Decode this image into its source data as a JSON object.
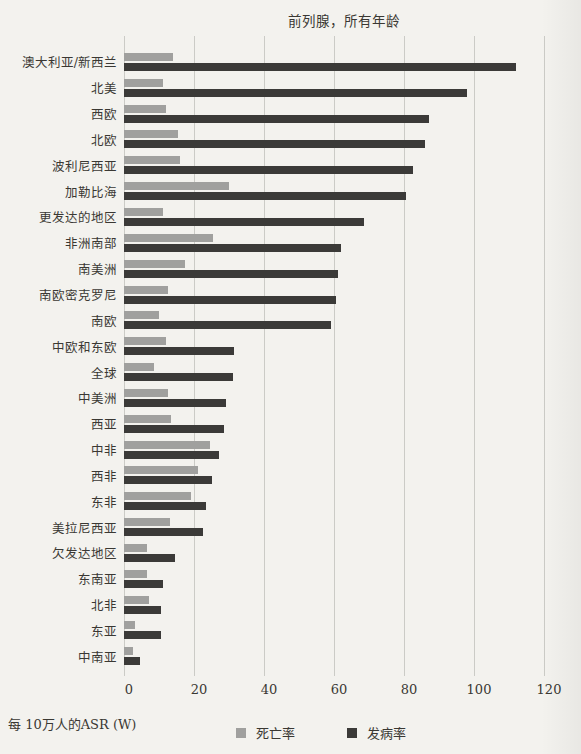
{
  "chart": {
    "title": "前列腺，所有年龄"
  },
  "chart_data": {
    "type": "bar",
    "orientation": "horizontal",
    "title": "前列腺，所有年龄",
    "xlabel": "每 10万人的ASR (W)",
    "xlim": [
      0,
      120
    ],
    "x_ticks": [
      0,
      20,
      40,
      60,
      80,
      100,
      120
    ],
    "grid": "vertical-only",
    "legend_position": "bottom-center",
    "categories": [
      "澳大利亚/新西兰",
      "北美",
      "西欧",
      "北欧",
      "波利尼西亚",
      "加勒比海",
      "更发达的地区",
      "非洲南部",
      "南美洲",
      "南欧密克罗尼",
      "南欧",
      "中欧和东欧",
      "全球",
      "中美洲",
      "西亚",
      "中非",
      "西非",
      "东非",
      "美拉尼西亚",
      "欠发达地区",
      "东南亚",
      "北非",
      "东亚",
      "中南亚"
    ],
    "series": [
      {
        "name": "死亡率",
        "color": "#a0a09e",
        "values": [
          14,
          11,
          12,
          15.5,
          16,
          30,
          11,
          25.5,
          17.5,
          12.5,
          10,
          12,
          8.5,
          12.5,
          13.5,
          24.5,
          21,
          19,
          13,
          6.5,
          6.5,
          7,
          3,
          2.5
        ]
      },
      {
        "name": "发病率",
        "color": "#3b3a38",
        "values": [
          112,
          98,
          87,
          86,
          82.5,
          80.5,
          68.5,
          62,
          61,
          60.5,
          59,
          31.5,
          31,
          29,
          28.5,
          27,
          25,
          23.5,
          22.5,
          14.5,
          11,
          10.5,
          10.5,
          4.5
        ]
      }
    ]
  }
}
